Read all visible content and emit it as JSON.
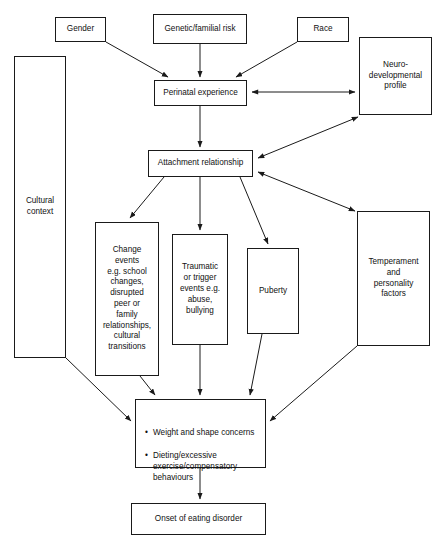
{
  "diagram": {
    "nodes": [
      {
        "id": "gender",
        "label": "Gender",
        "x": 55,
        "y": 17,
        "w": 51,
        "h": 25
      },
      {
        "id": "genetic",
        "label": "Genetic/familial risk",
        "x": 153,
        "y": 14,
        "w": 94,
        "h": 30
      },
      {
        "id": "race",
        "label": "Race",
        "x": 297,
        "y": 17,
        "w": 52,
        "h": 25
      },
      {
        "id": "neurodev",
        "label": "Neuro-\ndevelopmental\nprofile",
        "x": 359,
        "y": 37,
        "w": 73,
        "h": 78
      },
      {
        "id": "cultural",
        "label": "Cultural\ncontext",
        "x": 14,
        "y": 56,
        "w": 52,
        "h": 302
      },
      {
        "id": "perinatal",
        "label": "Perinatal experience",
        "x": 154,
        "y": 80,
        "w": 93,
        "h": 26
      },
      {
        "id": "attachment",
        "label": "Attachment relationship",
        "x": 148,
        "y": 150,
        "w": 105,
        "h": 27
      },
      {
        "id": "change",
        "label": "Change\nevents\ne.g. school\nchanges,\ndisrupted\npeer or\nfamily\nrelationships,\ncultural\ntransitions",
        "x": 95,
        "y": 222,
        "w": 64,
        "h": 154
      },
      {
        "id": "traumatic",
        "label": "Traumatic\nor trigger\nevents e.g.\nabuse,\nbullying",
        "x": 172,
        "y": 234,
        "w": 56,
        "h": 111
      },
      {
        "id": "puberty",
        "label": "Puberty",
        "x": 247,
        "y": 248,
        "w": 52,
        "h": 86
      },
      {
        "id": "temperament",
        "label": "Temperament\nand\npersonality\nfactors",
        "x": 357,
        "y": 211,
        "w": 73,
        "h": 135
      },
      {
        "id": "concerns",
        "label": "",
        "x": 135,
        "y": 399,
        "w": 131,
        "h": 69
      },
      {
        "id": "onset",
        "label": "Onset of eating disorder",
        "x": 131,
        "y": 503,
        "w": 135,
        "h": 32
      }
    ],
    "concerns_bullets": [
      "Weight and shape concerns",
      "Dieting/excessive exercise/compensatory behaviours"
    ],
    "colors": {
      "stroke": "#1a1a1a",
      "text": "#111111",
      "background": "#ffffff"
    },
    "edges": [
      {
        "from": "gender",
        "to": "perinatal",
        "type": "single"
      },
      {
        "from": "genetic",
        "to": "perinatal",
        "type": "single"
      },
      {
        "from": "race",
        "to": "perinatal",
        "type": "single"
      },
      {
        "from": "perinatal",
        "to": "neurodev",
        "type": "double"
      },
      {
        "from": "perinatal",
        "to": "attachment",
        "type": "single"
      },
      {
        "from": "neurodev",
        "to": "attachment",
        "type": "double"
      },
      {
        "from": "attachment",
        "to": "temperament",
        "type": "double"
      },
      {
        "from": "attachment",
        "to": "change",
        "type": "single"
      },
      {
        "from": "attachment",
        "to": "traumatic",
        "type": "single"
      },
      {
        "from": "attachment",
        "to": "puberty",
        "type": "single"
      },
      {
        "from": "cultural",
        "to": "concerns",
        "type": "single"
      },
      {
        "from": "change",
        "to": "concerns",
        "type": "single"
      },
      {
        "from": "traumatic",
        "to": "concerns",
        "type": "single"
      },
      {
        "from": "puberty",
        "to": "concerns",
        "type": "single"
      },
      {
        "from": "temperament",
        "to": "concerns",
        "type": "single"
      },
      {
        "from": "concerns",
        "to": "onset",
        "type": "single"
      }
    ]
  }
}
